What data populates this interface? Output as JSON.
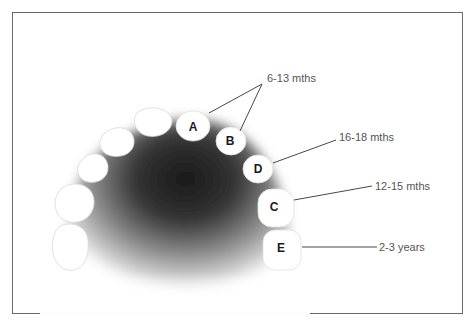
{
  "diagram": {
    "teeth": [
      {
        "id": "A",
        "label": "A",
        "x": 193,
        "y": 123
      },
      {
        "id": "B",
        "label": "B",
        "x": 230,
        "y": 141
      },
      {
        "id": "D",
        "label": "D",
        "x": 258,
        "y": 169
      },
      {
        "id": "C",
        "label": "C",
        "x": 274,
        "y": 207
      },
      {
        "id": "E",
        "label": "E",
        "x": 281,
        "y": 248
      }
    ],
    "callouts": [
      {
        "label": "6-13 mths",
        "teeth": [
          "A",
          "B"
        ]
      },
      {
        "label": "16-18 mths",
        "teeth": [
          "D"
        ]
      },
      {
        "label": "12-15 mths",
        "teeth": [
          "C"
        ]
      },
      {
        "label": "2-3 years",
        "teeth": [
          "E"
        ]
      }
    ]
  },
  "labels": {
    "a": "A",
    "b": "B",
    "c": "C",
    "d": "D",
    "e": "E",
    "age_ab": "6-13 mths",
    "age_d": "16-18 mths",
    "age_c": "12-15 mths",
    "age_e": "2-3 years"
  },
  "colors": {
    "frame": "#6a6a6a",
    "palate_dark": "#1c1c1c",
    "tooth_fill": "#ffffff",
    "leader_line": "#333333",
    "age_text": "#555555"
  }
}
